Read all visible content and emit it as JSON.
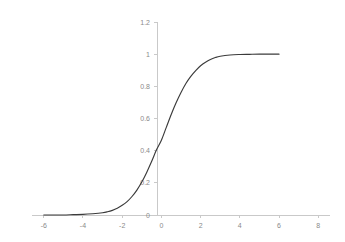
{
  "chart_data": {
    "type": "line",
    "title": "",
    "subtitle": "",
    "xlabel": "",
    "ylabel": "",
    "xlim": [
      -6.6,
      8.6
    ],
    "ylim": [
      -0.06,
      1.26
    ],
    "grid": false,
    "legend": null,
    "legend_position": "none",
    "background_color": "#ffffff",
    "x_ticks": [
      -6,
      -4,
      -2,
      0,
      2,
      4,
      6,
      8
    ],
    "x_tick_labels": [
      "-6",
      "-4",
      "-2",
      "0",
      "2",
      "4",
      "6",
      "8"
    ],
    "y_ticks": [
      0,
      0.2,
      0.4,
      0.6,
      0.8,
      1,
      1.2
    ],
    "y_tick_labels": [
      "0",
      "0.2",
      "0.4",
      "0.6",
      "0.8",
      "1",
      "1.2"
    ],
    "series": [
      {
        "name": "sigmoid",
        "color": "#3b3b3b",
        "line_width": 1.15,
        "x": [
          -6.0,
          -5.5,
          -5.0,
          -4.5,
          -4.0,
          -3.5,
          -3.0,
          -2.75,
          -2.5,
          -2.25,
          -2.0,
          -1.75,
          -1.5,
          -1.25,
          -1.0,
          -0.75,
          -0.5,
          -0.25,
          0.0,
          0.25,
          0.5,
          0.75,
          1.0,
          1.25,
          1.5,
          1.75,
          2.0,
          2.25,
          2.5,
          2.75,
          3.0,
          3.5,
          4.0,
          4.5,
          5.0,
          5.5,
          6.0
        ],
        "y": [
          0.0,
          0.0,
          0.0,
          0.002,
          0.004,
          0.008,
          0.014,
          0.02,
          0.029,
          0.042,
          0.06,
          0.083,
          0.115,
          0.155,
          0.205,
          0.265,
          0.332,
          0.405,
          0.465,
          0.545,
          0.625,
          0.698,
          0.762,
          0.818,
          0.862,
          0.898,
          0.928,
          0.95,
          0.967,
          0.979,
          0.987,
          0.995,
          0.998,
          0.999,
          1.0,
          1.0,
          1.0
        ]
      }
    ],
    "annotations": []
  },
  "axes": {
    "x_axis_name": "x-axis",
    "y_axis_name": "y-axis"
  }
}
